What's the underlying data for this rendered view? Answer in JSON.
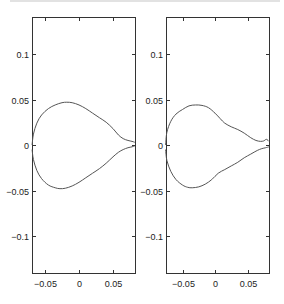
{
  "chart_data": [
    {
      "type": "line",
      "title": "",
      "xlabel": "",
      "ylabel": "",
      "xlim": [
        -0.069,
        0.082
      ],
      "ylim": [
        -0.14,
        0.135
      ],
      "xticks": [
        -0.05,
        0,
        0.05
      ],
      "xtick_labels": [
        "-0.05",
        "0",
        "0.05"
      ],
      "yticks": [
        0.1,
        0.05,
        0,
        -0.05,
        -0.1
      ],
      "ytick_labels": [
        "0.1",
        "0.05",
        "0",
        "-0.05",
        "-0.1"
      ],
      "grid": false,
      "legend": null,
      "series": [
        {
          "name": "upper",
          "x": [
            -0.069,
            -0.067,
            -0.062,
            -0.055,
            -0.045,
            -0.035,
            -0.025,
            -0.018,
            -0.01,
            0.0,
            0.01,
            0.02,
            0.03,
            0.04,
            0.05,
            0.058,
            0.065,
            0.072,
            0.078,
            0.082
          ],
          "y": [
            0.0,
            0.012,
            0.024,
            0.033,
            0.04,
            0.044,
            0.0465,
            0.047,
            0.0465,
            0.044,
            0.04,
            0.035,
            0.03,
            0.025,
            0.018,
            0.011,
            0.007,
            0.005,
            0.004,
            0.003
          ]
        },
        {
          "name": "lower",
          "x": [
            -0.069,
            -0.067,
            -0.062,
            -0.055,
            -0.045,
            -0.035,
            -0.028,
            -0.02,
            -0.01,
            0.0,
            0.01,
            0.02,
            0.03,
            0.04,
            0.05,
            0.058,
            0.065,
            0.072,
            0.078,
            0.082
          ],
          "y": [
            -0.005,
            -0.016,
            -0.028,
            -0.037,
            -0.044,
            -0.047,
            -0.048,
            -0.0475,
            -0.045,
            -0.041,
            -0.036,
            -0.031,
            -0.026,
            -0.02,
            -0.013,
            -0.008,
            -0.005,
            -0.003,
            -0.002,
            -0.001
          ]
        }
      ]
    },
    {
      "type": "line",
      "title": "",
      "xlabel": "",
      "ylabel": "",
      "xlim": [
        -0.076,
        0.083
      ],
      "ylim": [
        -0.14,
        0.135
      ],
      "xticks": [
        -0.05,
        0,
        0.05
      ],
      "xtick_labels": [
        "-0.05",
        "0",
        "0.05"
      ],
      "yticks": [
        0.1,
        0.05,
        0,
        -0.05,
        -0.1
      ],
      "ytick_labels": [
        "0.1",
        "0.05",
        "0",
        "-0.05",
        "-0.1"
      ],
      "grid": false,
      "legend": null,
      "series": [
        {
          "name": "upper",
          "x": [
            -0.076,
            -0.074,
            -0.068,
            -0.06,
            -0.05,
            -0.04,
            -0.03,
            -0.02,
            -0.01,
            0.0,
            0.008,
            0.015,
            0.025,
            0.035,
            0.045,
            0.055,
            0.063,
            0.07,
            0.075,
            0.078,
            0.08,
            0.083
          ],
          "y": [
            0.0,
            0.014,
            0.026,
            0.034,
            0.039,
            0.043,
            0.044,
            0.0435,
            0.041,
            0.035,
            0.029,
            0.024,
            0.02,
            0.017,
            0.013,
            0.008,
            0.005,
            0.004,
            0.0045,
            0.006,
            0.006,
            0.004
          ]
        },
        {
          "name": "lower",
          "x": [
            -0.076,
            -0.074,
            -0.068,
            -0.06,
            -0.05,
            -0.042,
            -0.035,
            -0.025,
            -0.015,
            -0.005,
            0.005,
            0.015,
            0.025,
            0.035,
            0.045,
            0.055,
            0.065,
            0.072,
            0.078,
            0.083
          ],
          "y": [
            -0.005,
            -0.017,
            -0.029,
            -0.038,
            -0.044,
            -0.0465,
            -0.047,
            -0.046,
            -0.043,
            -0.038,
            -0.031,
            -0.027,
            -0.023,
            -0.019,
            -0.014,
            -0.01,
            -0.006,
            -0.004,
            -0.003,
            -0.002
          ]
        }
      ]
    }
  ],
  "panels": [
    {
      "box": {
        "x0": 32,
        "x1": 135,
        "y0": 17,
        "y1": 273
      },
      "xticks": [
        {
          "label": "-0.05",
          "px": 45
        },
        {
          "label": "0",
          "px": 79
        },
        {
          "label": "0.05",
          "px": 113
        }
      ],
      "yticks": [
        {
          "label": "0.1",
          "py": 54
        },
        {
          "label": "0.05",
          "py": 100
        },
        {
          "label": "0",
          "py": 145
        },
        {
          "label": "-0.05",
          "py": 191
        },
        {
          "label": "-0.1",
          "py": 236
        }
      ]
    },
    {
      "box": {
        "x0": 166,
        "x1": 269,
        "y0": 17,
        "y1": 273
      },
      "xticks": [
        {
          "label": "-0.05",
          "px": 183
        },
        {
          "label": "0",
          "px": 215
        },
        {
          "label": "0.05",
          "px": 248
        }
      ],
      "yticks": [
        {
          "label": "0.1",
          "py": 54
        },
        {
          "label": "0.05",
          "py": 100
        },
        {
          "label": "0",
          "py": 145
        },
        {
          "label": "-0.05",
          "py": 191
        },
        {
          "label": "-0.1",
          "py": 236
        }
      ]
    }
  ],
  "colors": {
    "axis": "#333333",
    "curve": "#555555",
    "background": "#ffffff"
  }
}
